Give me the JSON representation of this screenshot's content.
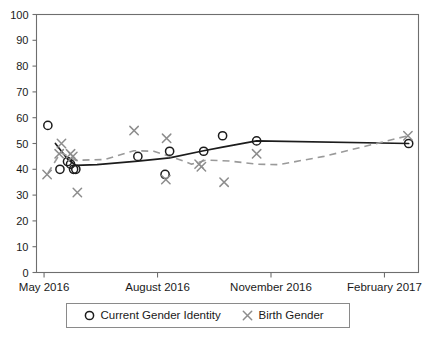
{
  "chart_data": {
    "type": "scatter",
    "title": "",
    "xlabel": "",
    "ylabel": "",
    "ylim": [
      0,
      100
    ],
    "yticks": [
      0,
      10,
      20,
      30,
      40,
      50,
      60,
      70,
      80,
      90,
      100
    ],
    "xticklabels": [
      "May 2016",
      "August 2016",
      "November 2016",
      "February 2017"
    ],
    "xtick_months": [
      0,
      3,
      6,
      9
    ],
    "xlim_months": [
      -0.2,
      9.9
    ],
    "grid": false,
    "legend_position": "below-axes",
    "series": [
      {
        "name": "Current Gender Identity",
        "marker": "circle",
        "color": "#1c1c1c",
        "linestyle": "solid",
        "points": [
          {
            "x": 0.1,
            "y": 57
          },
          {
            "x": 0.42,
            "y": 40
          },
          {
            "x": 0.62,
            "y": 43
          },
          {
            "x": 0.7,
            "y": 42
          },
          {
            "x": 0.78,
            "y": 40
          },
          {
            "x": 0.84,
            "y": 40
          },
          {
            "x": 2.48,
            "y": 45
          },
          {
            "x": 3.32,
            "y": 47
          },
          {
            "x": 3.2,
            "y": 38
          },
          {
            "x": 4.22,
            "y": 47
          },
          {
            "x": 4.72,
            "y": 53
          },
          {
            "x": 5.62,
            "y": 51
          },
          {
            "x": 9.64,
            "y": 50
          }
        ],
        "trend": [
          {
            "x": 0.3,
            "y": 50
          },
          {
            "x": 0.62,
            "y": 44
          },
          {
            "x": 0.84,
            "y": 41.5
          },
          {
            "x": 1.4,
            "y": 41.8
          },
          {
            "x": 2.48,
            "y": 43.2
          },
          {
            "x": 3.32,
            "y": 44.4
          },
          {
            "x": 4.22,
            "y": 47.2
          },
          {
            "x": 4.72,
            "y": 48.6
          },
          {
            "x": 5.62,
            "y": 51
          },
          {
            "x": 9.64,
            "y": 50
          }
        ]
      },
      {
        "name": "Birth Gender",
        "marker": "x",
        "color": "#8d8d8d",
        "linestyle": "dashed",
        "points": [
          {
            "x": 0.08,
            "y": 38
          },
          {
            "x": 0.46,
            "y": 50
          },
          {
            "x": 0.4,
            "y": 46
          },
          {
            "x": 0.7,
            "y": 46
          },
          {
            "x": 0.76,
            "y": 45
          },
          {
            "x": 0.88,
            "y": 31
          },
          {
            "x": 2.38,
            "y": 55
          },
          {
            "x": 3.24,
            "y": 52
          },
          {
            "x": 3.22,
            "y": 36
          },
          {
            "x": 4.1,
            "y": 42
          },
          {
            "x": 4.16,
            "y": 41
          },
          {
            "x": 4.76,
            "y": 35
          },
          {
            "x": 5.62,
            "y": 46
          },
          {
            "x": 9.62,
            "y": 53
          }
        ],
        "trend": [
          {
            "x": 0.1,
            "y": 38.5
          },
          {
            "x": 0.44,
            "y": 46.5
          },
          {
            "x": 0.84,
            "y": 43.5
          },
          {
            "x": 1.6,
            "y": 43.8
          },
          {
            "x": 2.38,
            "y": 47.2
          },
          {
            "x": 2.9,
            "y": 47.0
          },
          {
            "x": 3.46,
            "y": 44.4
          },
          {
            "x": 3.9,
            "y": 42.0
          },
          {
            "x": 4.3,
            "y": 43.6
          },
          {
            "x": 4.9,
            "y": 43.2
          },
          {
            "x": 5.62,
            "y": 42.0
          },
          {
            "x": 6.2,
            "y": 41.8
          },
          {
            "x": 7.4,
            "y": 45.0
          },
          {
            "x": 9.62,
            "y": 53
          }
        ]
      }
    ]
  },
  "legend": {
    "entries": [
      {
        "symbol": "O",
        "label": "Current Gender Identity"
      },
      {
        "symbol": "×",
        "label": "Birth Gender"
      }
    ]
  },
  "colors": {
    "series_a": "#1c1c1c",
    "series_b": "#8d8d8d",
    "axis": "#6e6e6e",
    "background": "#ffffff"
  }
}
